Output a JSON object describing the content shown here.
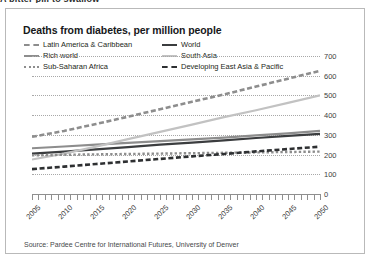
{
  "clipped_heading": "A bitter pill to swallow",
  "card": {
    "title": "Deaths from diabetes, per million people",
    "source": "Source: Pardee Centre for International Futures, University of Denver"
  },
  "legend": {
    "entries": [
      {
        "label": "Latin America & Caribbean",
        "style": "dashed",
        "color": "#8d8d8d",
        "width": 2.2,
        "column": 1,
        "row": 1
      },
      {
        "label": "World",
        "style": "solid",
        "color": "#3b3d3f",
        "width": 2.4,
        "column": 2,
        "row": 1
      },
      {
        "label": "Rich world",
        "style": "solid",
        "color": "#8d8d8d",
        "width": 2.2,
        "column": 1,
        "row": 2
      },
      {
        "label": "South Asia",
        "style": "solid",
        "color": "#c2c2c2",
        "width": 2.2,
        "column": 2,
        "row": 2
      },
      {
        "label": "Sub-Saharan Africa",
        "style": "dotted",
        "color": "#8d8d8d",
        "width": 2.2,
        "column": 1,
        "row": 3
      },
      {
        "label": "Developing East Asia & Pacific",
        "style": "dashed",
        "color": "#2e3032",
        "width": 2.6,
        "column": 2,
        "row": 3
      }
    ]
  },
  "chart_data": {
    "type": "line",
    "title": "Deaths from diabetes, per million people",
    "xlabel": "",
    "ylabel": "deaths per million people",
    "ylim": [
      0,
      700
    ],
    "yticks": [
      0,
      100,
      200,
      300,
      400,
      500,
      600,
      700
    ],
    "y_axis_position": "right",
    "xlim": [
      2005,
      2050
    ],
    "xticks_labeled": [
      2005,
      2010,
      2015,
      2020,
      2025,
      2030,
      2035,
      2040,
      2045,
      2050
    ],
    "xtick_interval_minor": 1,
    "xtick_label_rotation": -45,
    "grid": "horizontal-dotted",
    "legend_position": "top",
    "x": [
      2005,
      2010,
      2015,
      2020,
      2025,
      2030,
      2035,
      2040,
      2045,
      2050
    ],
    "series": [
      {
        "name": "Latin America & Caribbean",
        "style": "dashed",
        "color": "#8d8d8d",
        "values": [
          290,
          320,
          355,
          392,
          430,
          468,
          505,
          545,
          585,
          625
        ]
      },
      {
        "name": "World",
        "style": "solid",
        "color": "#3b3d3f",
        "values": [
          205,
          215,
          226,
          238,
          250,
          261,
          272,
          284,
          295,
          305
        ]
      },
      {
        "name": "Rich world",
        "style": "solid",
        "color": "#8d8d8d",
        "values": [
          232,
          241,
          250,
          259,
          268,
          277,
          286,
          297,
          308,
          320
        ]
      },
      {
        "name": "South Asia",
        "style": "solid",
        "color": "#c2c2c2",
        "values": [
          175,
          205,
          240,
          278,
          315,
          352,
          390,
          425,
          462,
          500
        ]
      },
      {
        "name": "Sub-Saharan Africa",
        "style": "dotted",
        "color": "#8d8d8d",
        "values": [
          196,
          199,
          201,
          203,
          205,
          207,
          209,
          211,
          213,
          215
        ]
      },
      {
        "name": "Developing East Asia & Pacific",
        "style": "dashed",
        "color": "#2e3032",
        "values": [
          126,
          139,
          152,
          165,
          178,
          191,
          203,
          216,
          228,
          240
        ]
      }
    ]
  }
}
